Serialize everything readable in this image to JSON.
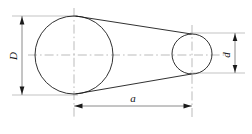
{
  "drawing": {
    "title": "Two-pulley belt drive schematic",
    "background_color": "#ffffff",
    "line_color": "#1a1a1a",
    "centerline_color": "#8d8d8d",
    "dimension_color": "#4a4a4a",
    "labels": {
      "large_diameter": "D",
      "small_diameter": "d",
      "center_distance": "a"
    },
    "shapes": {
      "large_pulley": {
        "cx": 74,
        "cy": 55,
        "r": 39
      },
      "small_pulley": {
        "cx": 192,
        "cy": 54,
        "r": 20
      }
    },
    "dimensions": [
      {
        "name": "large_diameter",
        "label": "D",
        "orientation": "vertical",
        "x": 22,
        "y1": 16,
        "y2": 95
      },
      {
        "name": "small_diameter",
        "label": "d",
        "orientation": "vertical",
        "x": 235,
        "y1": 33,
        "y2": 73
      },
      {
        "name": "center_distance",
        "label": "a",
        "orientation": "horizontal",
        "y": 106,
        "x1": 74,
        "x2": 192
      }
    ]
  }
}
